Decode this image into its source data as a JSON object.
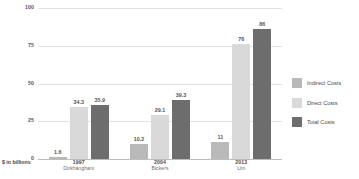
{
  "chart_data": {
    "type": "bar",
    "title": "",
    "subtitle": "",
    "xlabel": "",
    "ylabel": "$ in billions",
    "ylim": [
      0,
      100
    ],
    "ytick_labels": [
      "100",
      "75",
      "50",
      "25",
      "0"
    ],
    "ytick_values": [
      100,
      75,
      50,
      25,
      0
    ],
    "grid": true,
    "legend_position": "right",
    "categories": [
      "1997",
      "2004",
      "2013"
    ],
    "category_sublabels": [
      "Dirkhanghani",
      "Bickers",
      "Lim"
    ],
    "series": [
      {
        "name": "Indirect Costs",
        "color": "#b9b9b9",
        "values": [
          1.6,
          10.2,
          11
        ],
        "value_labels": [
          "1.6",
          "10.2",
          "11"
        ]
      },
      {
        "name": "Direct Costs",
        "color": "#d9d9d9",
        "values": [
          34.3,
          29.1,
          76
        ],
        "value_labels": [
          "34.3",
          "29.1",
          "76"
        ]
      },
      {
        "name": "Total Costs",
        "color": "#6d6d6d",
        "values": [
          35.9,
          39.3,
          86
        ],
        "value_labels": [
          "35.9",
          "39.3",
          "86"
        ]
      }
    ]
  },
  "axis": {
    "unit_caption": "$ in billions"
  },
  "legend": {
    "items": [
      {
        "label": "Indirect Costs",
        "color": "#b9b9b9"
      },
      {
        "label": "Direct Costs",
        "color": "#d9d9d9"
      },
      {
        "label": "Total Costs",
        "color": "#6d6d6d"
      }
    ]
  },
  "colors": {
    "indirect": "#b9b9b9",
    "direct": "#d9d9d9",
    "total": "#6d6d6d",
    "gridline": "#e3e3e3",
    "baseline": "#bdbdbd",
    "text": "#4a4a4a",
    "background": "#ffffff"
  }
}
